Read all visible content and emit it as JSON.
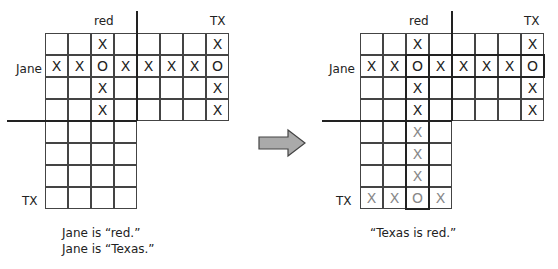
{
  "left_panel": {
    "col_labels": {
      "red": "red",
      "tx": "TX"
    },
    "row_labels": {
      "jane": "Jane",
      "tx": "TX"
    },
    "top_grid": [
      [
        "",
        "",
        "X",
        "",
        "",
        "",
        "",
        "X"
      ],
      [
        "X",
        "X",
        "O",
        "X",
        "X",
        "X",
        "X",
        "O"
      ],
      [
        "",
        "",
        "X",
        "",
        "",
        "",
        "",
        "X"
      ],
      [
        "",
        "",
        "X",
        "",
        "",
        "",
        "",
        "X"
      ]
    ],
    "bottom_grid": [
      [
        "",
        "",
        "",
        ""
      ],
      [
        "",
        "",
        "",
        ""
      ],
      [
        "",
        "",
        "",
        ""
      ],
      [
        "",
        "",
        "",
        ""
      ]
    ],
    "caption_line1": "Jane is “red.”",
    "caption_line2": "Jane is “Texas.”"
  },
  "arrow": {
    "icon": "right-arrow-icon",
    "fill": "#aaaaaa"
  },
  "right_panel": {
    "col_labels": {
      "red": "red",
      "tx": "TX"
    },
    "row_labels": {
      "jane": "Jane",
      "tx": "TX"
    },
    "top_grid": [
      [
        "",
        "",
        "X",
        "",
        "",
        "",
        "",
        "X"
      ],
      [
        "X",
        "X",
        "O",
        "X",
        "X",
        "X",
        "X",
        "O"
      ],
      [
        "",
        "",
        "X",
        "",
        "",
        "",
        "",
        "X"
      ],
      [
        "",
        "",
        "X",
        "",
        "",
        "",
        "",
        "X"
      ]
    ],
    "bottom_grid": [
      [
        "",
        "",
        "X",
        ""
      ],
      [
        "",
        "",
        "X",
        ""
      ],
      [
        "",
        "",
        "X",
        ""
      ],
      [
        "X",
        "X",
        "O",
        "X"
      ]
    ],
    "caption": "“Texas is red.”"
  }
}
